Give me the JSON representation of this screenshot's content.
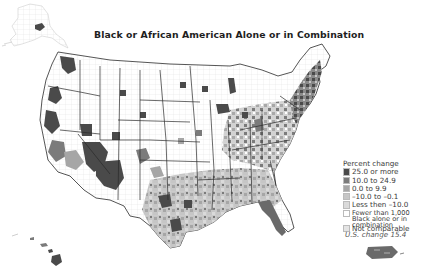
{
  "map": {
    "title": "Black or African American Alone or in Combination",
    "subject": "Percent change in Black or African American alone or in combination population by county",
    "region": "United States (counties, incl. Alaska, Hawaii, Puerto Rico)",
    "us_change_label": "U.S. change 15.4"
  },
  "legend": {
    "title": "Percent change",
    "items": [
      {
        "label": "25.0 or more",
        "color": "#4a4a4a"
      },
      {
        "label": "10.0 to 24.9",
        "color": "#7b7b7b"
      },
      {
        "label": "0.0 to 9.9",
        "color": "#a6a6a6"
      },
      {
        "label": "–10.0 to –0.1",
        "color": "#c6c6c6"
      },
      {
        "label": "Less then –10.0",
        "color": "#dadada"
      },
      {
        "label": "Fewer than 1,000 Black alone or in combination",
        "color": "#ffffff"
      },
      {
        "label": "Not comparable",
        "color": "#e4e4e4"
      }
    ]
  },
  "colors": {
    "border_state": "#2a2a2a",
    "border_county": "#d8d8d8",
    "background": "#ffffff"
  }
}
